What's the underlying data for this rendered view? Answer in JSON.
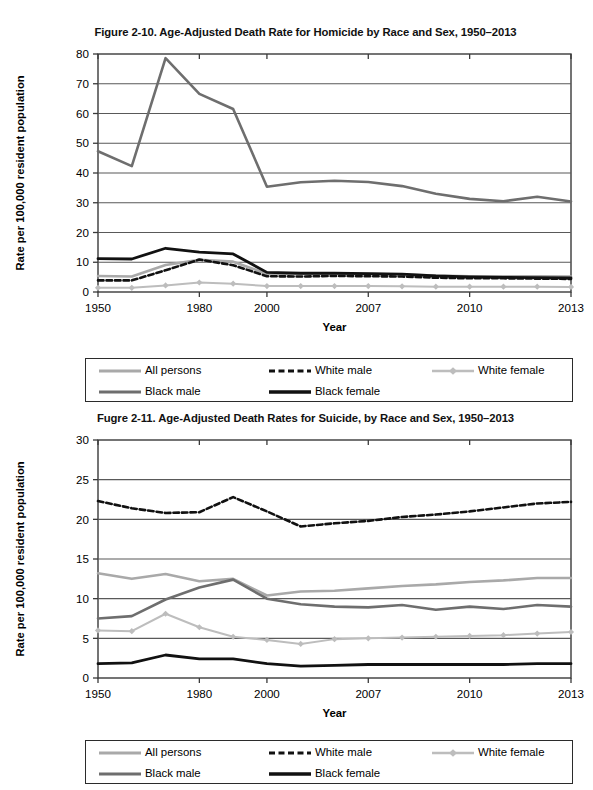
{
  "document": {
    "background": "#ffffff",
    "width": 593,
    "height": 790
  },
  "figures": [
    {
      "id": "figure-2-10",
      "title": "Figure 2-10. Age-Adjusted Death Rate for Homicide by Race and Sex, 1950–2013",
      "ylabel": "Rate per 100,000 resident population",
      "xlabel": "Year"
    },
    {
      "id": "figure-2-11",
      "title": "Fugre 2-11. Age-Adjusted Death Rates for Suicide, by Race and Sex, 1950–2013",
      "ylabel": "Rate per 100,000 resident population",
      "xlabel": "Year"
    }
  ],
  "legend": {
    "items": [
      {
        "label": "All persons",
        "color": "#a9a9a9",
        "style": "solid",
        "width": 2.6,
        "marker": "none"
      },
      {
        "label": "White male",
        "color": "#111111",
        "style": "dashed",
        "width": 2.6,
        "marker": "none"
      },
      {
        "label": "White female",
        "color": "#bdbdbd",
        "style": "solid",
        "width": 2.0,
        "marker": "diamond"
      },
      {
        "label": "Black male",
        "color": "#6e6e6e",
        "style": "solid",
        "width": 2.6,
        "marker": "none"
      },
      {
        "label": "Black female",
        "color": "#111111",
        "style": "solid",
        "width": 2.8,
        "marker": "none"
      }
    ]
  },
  "chart_data": [
    {
      "type": "line",
      "title": "Figure 2-10. Age-Adjusted Death Rate for Homicide by Race and Sex, 1950–2013",
      "xlabel": "Year",
      "ylabel": "Rate per 100,000 resident population",
      "grid": true,
      "legend_position": "below",
      "ylim": [
        0,
        80
      ],
      "yticks": [
        0,
        10,
        20,
        30,
        40,
        50,
        60,
        70,
        80
      ],
      "x": [
        1950,
        1960,
        1970,
        1980,
        1990,
        2000,
        2005,
        2006,
        2007,
        2008,
        2009,
        2010,
        2011,
        2012,
        2013
      ],
      "xtick_labels": [
        "1950",
        "1980",
        "2000",
        "2007",
        "2010",
        "2013"
      ],
      "xtick_index": [
        0,
        3,
        5,
        8,
        11,
        14
      ],
      "series": [
        {
          "name": "All persons",
          "values": [
            5.4,
            5.2,
            9.1,
            10.8,
            10.2,
            6.1,
            6.1,
            6.2,
            6.1,
            5.9,
            5.5,
            5.3,
            5.3,
            5.3,
            5.2
          ]
        },
        {
          "name": "White male",
          "values": [
            3.9,
            3.9,
            7.3,
            10.9,
            9.0,
            5.3,
            5.2,
            5.4,
            5.3,
            5.2,
            4.8,
            4.6,
            4.6,
            4.5,
            4.4
          ]
        },
        {
          "name": "White female",
          "values": [
            1.4,
            1.4,
            2.2,
            3.2,
            2.8,
            2.0,
            2.0,
            2.0,
            2.0,
            1.9,
            1.8,
            1.8,
            1.8,
            1.8,
            1.7
          ]
        },
        {
          "name": "Black male",
          "values": [
            47.3,
            42.3,
            78.6,
            66.6,
            61.5,
            35.4,
            36.9,
            37.4,
            37.0,
            35.6,
            33.0,
            31.3,
            30.5,
            32.0,
            30.4
          ]
        },
        {
          "name": "Black female",
          "values": [
            11.2,
            11.1,
            14.7,
            13.4,
            12.8,
            6.6,
            6.3,
            6.3,
            6.2,
            6.0,
            5.4,
            5.1,
            4.9,
            4.8,
            4.7
          ]
        }
      ]
    },
    {
      "type": "line",
      "title": "Fugre 2-11. Age-Adjusted Death Rates for Suicide, by Race and Sex, 1950–2013",
      "xlabel": "Year",
      "ylabel": "Rate per 100,000 resident population",
      "grid": true,
      "legend_position": "below",
      "ylim": [
        0,
        30
      ],
      "yticks": [
        0,
        5,
        10,
        15,
        20,
        25,
        30
      ],
      "x": [
        1950,
        1960,
        1970,
        1980,
        1990,
        2000,
        2005,
        2006,
        2007,
        2008,
        2009,
        2010,
        2011,
        2012,
        2013
      ],
      "xtick_labels": [
        "1950",
        "1980",
        "2000",
        "2007",
        "2010",
        "2013"
      ],
      "xtick_index": [
        0,
        3,
        5,
        8,
        11,
        14
      ],
      "series": [
        {
          "name": "All persons",
          "values": [
            13.2,
            12.5,
            13.1,
            12.2,
            12.5,
            10.4,
            10.9,
            11.0,
            11.3,
            11.6,
            11.8,
            12.1,
            12.3,
            12.6,
            12.6
          ]
        },
        {
          "name": "White male",
          "values": [
            22.3,
            21.4,
            20.8,
            20.9,
            22.8,
            21.0,
            19.1,
            19.5,
            19.8,
            20.3,
            20.6,
            21.0,
            21.5,
            22.0,
            22.2
          ]
        },
        {
          "name": "White female",
          "values": [
            6.0,
            5.9,
            8.1,
            6.4,
            5.2,
            4.8,
            4.3,
            4.9,
            5.0,
            5.1,
            5.2,
            5.3,
            5.4,
            5.6,
            5.8
          ]
        },
        {
          "name": "Black male",
          "values": [
            7.5,
            7.8,
            9.9,
            11.4,
            12.4,
            10.0,
            9.3,
            9.0,
            8.9,
            9.2,
            8.6,
            9.0,
            8.7,
            9.2,
            9.0
          ]
        },
        {
          "name": "Black female",
          "values": [
            1.8,
            1.9,
            2.9,
            2.4,
            2.4,
            1.8,
            1.5,
            1.6,
            1.7,
            1.7,
            1.7,
            1.7,
            1.7,
            1.8,
            1.8
          ]
        }
      ]
    }
  ],
  "plot_geometry": {
    "left": 98,
    "right": 571,
    "top": 12,
    "bottom": 250,
    "tick_len": 5,
    "axis_color": "#3a3a3a",
    "grid_color": "#595959"
  }
}
